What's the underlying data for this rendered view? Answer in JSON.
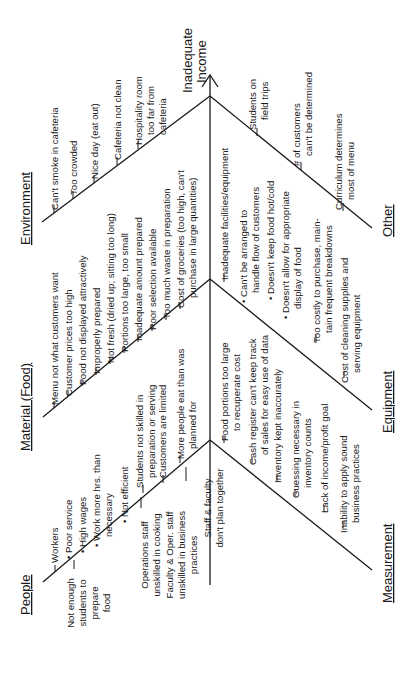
{
  "diagram": {
    "type": "fishbone",
    "orientation": "rotated 90 degrees counter-clockwise",
    "effect": [
      "Inadequate",
      "Income"
    ],
    "categories": {
      "people": {
        "label": "People",
        "items": [
          {
            "lines": [
              "Workers"
            ]
          },
          {
            "lines": [
              "• Poor service"
            ]
          },
          {
            "lines": [
              "• High wages"
            ]
          },
          {
            "lines": [
              "• Work more hrs. than",
              "necessary"
            ]
          },
          {
            "lines": [
              "• Not efficient"
            ]
          },
          {
            "lines": [
              "Not enough",
              "students to",
              "prepare",
              "food"
            ]
          },
          {
            "lines": [
              "Operations staff",
              "unskilled in cooking"
            ]
          },
          {
            "lines": [
              "Faculty & Oper. staff",
              "unskilled in business",
              "practices"
            ]
          },
          {
            "lines": [
              "Staff & faculty",
              "don't plan together"
            ]
          },
          {
            "lines": [
              "Students not skilled in",
              "preparation or serving"
            ]
          },
          {
            "lines": [
              "Customers are limited"
            ]
          },
          {
            "lines": [
              "More people eat than was",
              "planned for"
            ]
          }
        ]
      },
      "material": {
        "label": "Material (Food)",
        "items": [
          {
            "lines": [
              "Menu not what customers want"
            ]
          },
          {
            "lines": [
              "Customer prices too high"
            ]
          },
          {
            "lines": [
              "Food not displayed attractively"
            ]
          },
          {
            "lines": [
              "Improperly prepared"
            ]
          },
          {
            "lines": [
              "Not fresh (dried up; sitting too long)"
            ]
          },
          {
            "lines": [
              "Portions too large, too small"
            ]
          },
          {
            "lines": [
              "Inadequate amount prepared"
            ]
          },
          {
            "lines": [
              "Poor selection available"
            ]
          },
          {
            "lines": [
              "Too much waste in preparation"
            ]
          },
          {
            "lines": [
              "Cost of groceries (too high, can't",
              "purchase in large quantities)"
            ]
          }
        ]
      },
      "environment": {
        "label": "Environment",
        "items": [
          {
            "lines": [
              "Can't smoke in cafeteria"
            ]
          },
          {
            "lines": [
              "Too crowded"
            ]
          },
          {
            "lines": [
              "Nice day (eat out)"
            ]
          },
          {
            "lines": [
              "Cafeteria not clean"
            ]
          },
          {
            "lines": [
              "Hospitality room",
              "too far from",
              "cafeteria"
            ]
          }
        ]
      },
      "measurement": {
        "label": "Measurement",
        "items": [
          {
            "lines": [
              "Food portions too large",
              "to recuperate cost"
            ]
          },
          {
            "lines": [
              "Cash register can't keep track",
              "of sales for easy use of data"
            ]
          },
          {
            "lines": [
              "Inventory kept inaccurately"
            ]
          },
          {
            "lines": [
              "Guessing necessary in",
              "inventory counts"
            ]
          },
          {
            "lines": [
              "Lack of income/profit goal"
            ]
          },
          {
            "lines": [
              "Inability to apply sound",
              "business practices"
            ]
          }
        ]
      },
      "equipment": {
        "label": "Equipment",
        "items": [
          {
            "lines": [
              "Inadequate facilities/equipment"
            ]
          },
          {
            "lines": [
              "• Can't be arranged to",
              "handle flow of customers"
            ]
          },
          {
            "lines": [
              "• Doesn't keep food hot/cold"
            ]
          },
          {
            "lines": [
              "• Doesn't allow for appropriate",
              "display of food"
            ]
          },
          {
            "lines": [
              "Too costly to purchase, main-",
              "tain frequent breakdowns"
            ]
          },
          {
            "lines": [
              "Cost of cleaning supplies and",
              "serving equipment"
            ]
          }
        ]
      },
      "other": {
        "label": "Other",
        "items": [
          {
            "lines": [
              "Students on",
              "field trips"
            ]
          },
          {
            "lines": [
              "# of customers",
              "can't be determined"
            ]
          },
          {
            "lines": [
              "Curriculum determines",
              "most of menu"
            ]
          }
        ]
      }
    }
  }
}
